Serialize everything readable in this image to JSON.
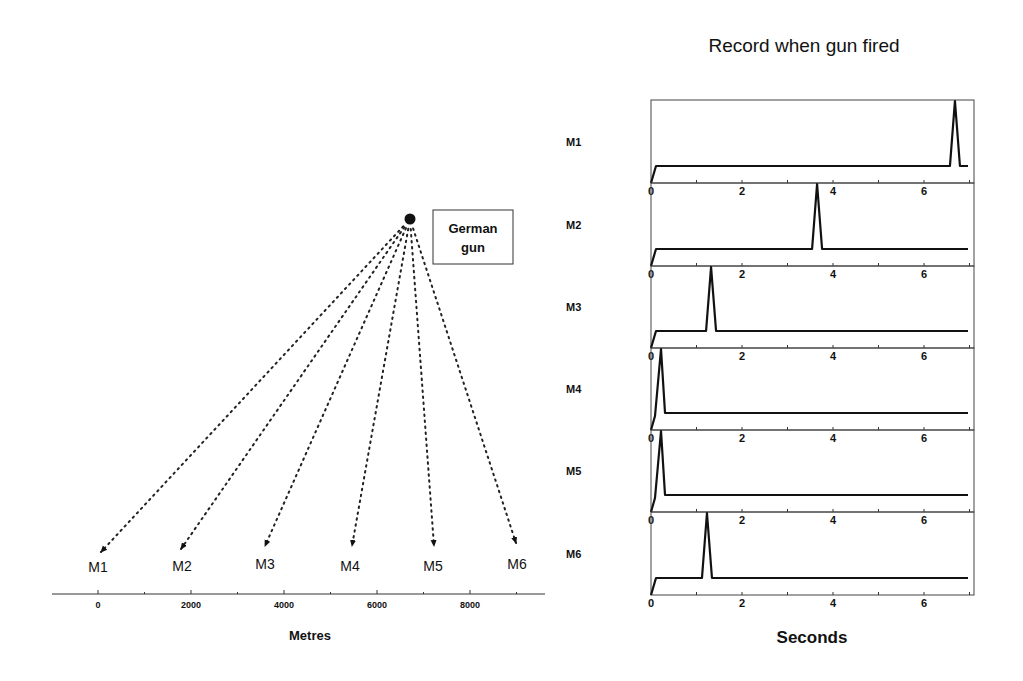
{
  "title": "Record when gun fired",
  "gun": {
    "label_line1": "German",
    "label_line2": "gun",
    "position_px": [
      410,
      219
    ]
  },
  "metres_axis": {
    "label": "Metres",
    "ticks": [
      "0",
      "2000",
      "4000",
      "6000",
      "8000"
    ],
    "tick_values": [
      0,
      2000,
      4000,
      6000,
      8000
    ],
    "range": [
      -1000,
      9700
    ]
  },
  "stations": [
    {
      "name": "M1",
      "arrow_end_px": [
        101,
        552
      ],
      "label_px": [
        98,
        567
      ]
    },
    {
      "name": "M2",
      "arrow_end_px": [
        181,
        549
      ],
      "label_px": [
        182,
        566
      ]
    },
    {
      "name": "M3",
      "arrow_end_px": [
        265,
        546
      ],
      "label_px": [
        265,
        564
      ]
    },
    {
      "name": "M4",
      "arrow_end_px": [
        352,
        546
      ],
      "label_px": [
        350,
        566
      ]
    },
    {
      "name": "M5",
      "arrow_end_px": [
        434,
        546
      ],
      "label_px": [
        433,
        566
      ]
    },
    {
      "name": "M6",
      "arrow_end_px": [
        516,
        543
      ],
      "label_px": [
        517,
        564
      ]
    }
  ],
  "seconds_axis": {
    "label": "Seconds",
    "ticks": [
      "0",
      "2",
      "4",
      "6"
    ],
    "range": [
      0,
      7.1
    ]
  },
  "chart_data": {
    "type": "line",
    "title": "Record when gun fired",
    "xlabel": "Seconds",
    "ylabel": "",
    "xlim": [
      0,
      7.1
    ],
    "x_ticks": [
      0,
      2,
      4,
      6
    ],
    "series": [
      {
        "name": "M1",
        "peak_time_s": 6.68
      },
      {
        "name": "M2",
        "peak_time_s": 3.65
      },
      {
        "name": "M3",
        "peak_time_s": 1.32
      },
      {
        "name": "M4",
        "peak_time_s": 0.22
      },
      {
        "name": "M5",
        "peak_time_s": 0.22
      },
      {
        "name": "M6",
        "peak_time_s": 1.23
      }
    ]
  },
  "colors": {
    "ink": "#111111",
    "frame": "#444444",
    "background": "#ffffff"
  }
}
